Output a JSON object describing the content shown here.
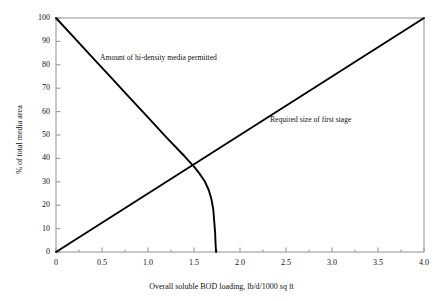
{
  "chart_data": {
    "type": "line",
    "title": "",
    "subtitle": "",
    "xlabel": "Overall soluble BOD loading, lb/d/1000 sq ft",
    "ylabel": "% of total media area",
    "xlim": [
      0,
      4.0
    ],
    "ylim": [
      0,
      100
    ],
    "grid": false,
    "legend_position": "none",
    "x_ticks": [
      "0",
      "0.5",
      "1.0",
      "1.5",
      "2.0",
      "2.5",
      "3.0",
      "3.5",
      "4.0"
    ],
    "x_tick_values": [
      0,
      0.5,
      1.0,
      1.5,
      2.0,
      2.5,
      3.0,
      3.5,
      4.0
    ],
    "x_minor_tick_values": [
      0.25,
      0.75,
      1.25,
      1.75,
      2.25,
      2.75,
      3.25,
      3.75
    ],
    "y_ticks": [
      "0",
      "10",
      "20",
      "30",
      "40",
      "50",
      "60",
      "70",
      "80",
      "90",
      "100"
    ],
    "y_tick_values": [
      0,
      10,
      20,
      30,
      40,
      50,
      60,
      70,
      80,
      90,
      100
    ],
    "series": [
      {
        "name": "Amount of hi-density media permitted",
        "annotation": "Amount of hi-density media permitted",
        "color": "#000000",
        "linewidth": 1.9,
        "points": [
          [
            0.0,
            100.0
          ],
          [
            0.2,
            91.5
          ],
          [
            0.4,
            83.0
          ],
          [
            0.6,
            74.5
          ],
          [
            0.8,
            66.0
          ],
          [
            1.0,
            57.5
          ],
          [
            1.2,
            49.0
          ],
          [
            1.4,
            40.8
          ],
          [
            1.5,
            36.5
          ],
          [
            1.56,
            33.5
          ],
          [
            1.62,
            30.0
          ],
          [
            1.66,
            26.5
          ],
          [
            1.69,
            22.5
          ],
          [
            1.71,
            18.0
          ],
          [
            1.72,
            13.0
          ],
          [
            1.73,
            8.0
          ],
          [
            1.735,
            3.0
          ],
          [
            1.74,
            0.0
          ]
        ]
      },
      {
        "name": "Required size of first stage",
        "annotation": "Required size of first stage",
        "color": "#000000",
        "linewidth": 1.9,
        "points": [
          [
            0.0,
            0.0
          ],
          [
            0.5,
            12.5
          ],
          [
            1.0,
            25.0
          ],
          [
            1.5,
            37.5
          ],
          [
            2.0,
            50.0
          ],
          [
            2.5,
            62.5
          ],
          [
            3.0,
            75.0
          ],
          [
            3.5,
            87.5
          ],
          [
            4.0,
            100.0
          ]
        ]
      }
    ],
    "annotations": [
      {
        "text": "Amount of hi-density media permitted",
        "x": 0.48,
        "y": 79.0
      },
      {
        "text": "Required size of first stage",
        "x": 2.33,
        "y": 53.0
      }
    ],
    "intersection": {
      "x": 1.47,
      "y": 38.0
    },
    "asymptote_x": 1.74,
    "colors": {
      "frame": "#9a9a9a",
      "curve": "#000000",
      "background": "#ffffff",
      "text": "#111111"
    }
  }
}
